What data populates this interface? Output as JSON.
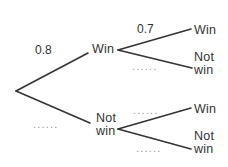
{
  "diagram": {
    "colors": {
      "background": "#ffffff",
      "line": "#333333",
      "text": "#333333",
      "dots": "#969696"
    },
    "branches": [
      {
        "id": "branch-root-win",
        "x1": 16,
        "y1": 91,
        "x2": 88,
        "y2": 53
      },
      {
        "id": "branch-root-notwin",
        "x1": 16,
        "y1": 91,
        "x2": 90,
        "y2": 123
      },
      {
        "id": "branch-win-win",
        "x1": 118,
        "y1": 50,
        "x2": 191,
        "y2": 29
      },
      {
        "id": "branch-win-notwin",
        "x1": 118,
        "y1": 50,
        "x2": 192,
        "y2": 68
      },
      {
        "id": "branch-notwin-win",
        "x1": 118,
        "y1": 129,
        "x2": 191,
        "y2": 108
      },
      {
        "id": "branch-notwin-notwin",
        "x1": 118,
        "y1": 129,
        "x2": 191,
        "y2": 149
      }
    ],
    "labels": [
      {
        "id": "prob-root-win",
        "text": "0.8",
        "x": 35,
        "y": 44,
        "kind": "prob"
      },
      {
        "id": "node-win-level1",
        "text": "Win",
        "x": 92,
        "y": 43,
        "kind": "node"
      },
      {
        "id": "prob-win-win",
        "text": "0.7",
        "x": 137,
        "y": 23,
        "kind": "prob"
      },
      {
        "id": "node-win-win",
        "text": "Win",
        "x": 194,
        "y": 24,
        "kind": "node"
      },
      {
        "id": "dots-win-notwin",
        "text": "......",
        "x": 132,
        "y": 61,
        "kind": "dots"
      },
      {
        "id": "node-win-notwin",
        "text": "Not win",
        "x": 194,
        "y": 51,
        "kind": "node wrap"
      },
      {
        "id": "dots-root-notwin",
        "text": "......",
        "x": 33,
        "y": 119,
        "kind": "dots"
      },
      {
        "id": "node-notwin-level1",
        "text": "Not win",
        "x": 96,
        "y": 112,
        "kind": "node wrap"
      },
      {
        "id": "dots-notwin-win",
        "text": "......",
        "x": 133,
        "y": 105,
        "kind": "dots"
      },
      {
        "id": "node-notwin-win",
        "text": "Win",
        "x": 194,
        "y": 103,
        "kind": "node"
      },
      {
        "id": "dots-notwin-notwin",
        "text": "......",
        "x": 136,
        "y": 143,
        "kind": "dots"
      },
      {
        "id": "node-notwin-notwin",
        "text": "Not win",
        "x": 194,
        "y": 130,
        "kind": "node wrap"
      }
    ]
  }
}
